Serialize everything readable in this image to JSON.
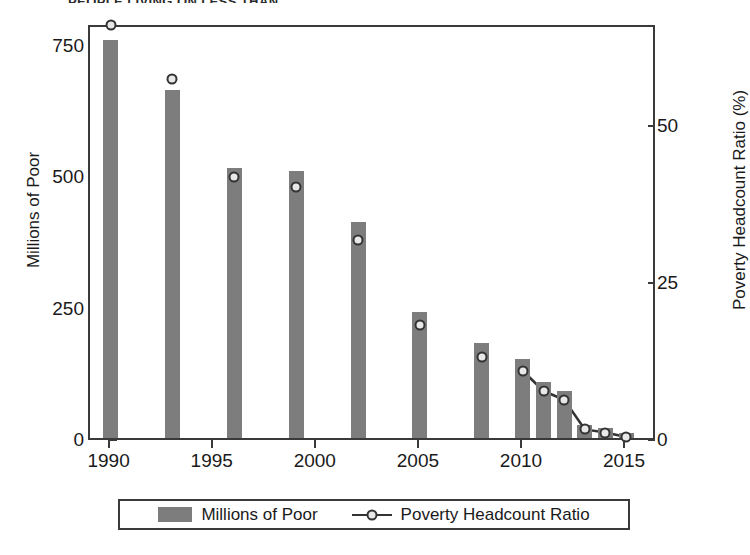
{
  "chart_data": {
    "type": "bar",
    "title": "PEOPLE LIVING ON LESS THAN",
    "xlabel": "",
    "ylabel": "Millions of Poor",
    "y2label": "Poverty Headcount Ratio (%)",
    "categories": [
      "1990",
      "1993",
      "1996",
      "1999",
      "2002",
      "2005",
      "2008",
      "2010",
      "2011",
      "2012",
      "2013",
      "2014",
      "2015"
    ],
    "x": [
      1990,
      1993,
      1996,
      1999,
      2002,
      2005,
      2008,
      2010,
      2011,
      2012,
      2013,
      2014,
      2015
    ],
    "xlim": [
      1989,
      2016.5
    ],
    "ylim": [
      0,
      790
    ],
    "y2lim": [
      0,
      66
    ],
    "grid": false,
    "legend_position": "bottom",
    "series": [
      {
        "name": "Millions of Poor",
        "type": "bar",
        "axis": "left",
        "color": "#7d7d7d",
        "values": [
          757,
          663,
          514,
          509,
          411,
          240,
          180,
          150,
          107,
          89,
          25,
          19,
          10
        ]
      },
      {
        "name": "Poverty Headcount Ratio",
        "type": "line",
        "axis": "right",
        "color": "#333333",
        "marker": "circle",
        "values": [
          66.3,
          57.8,
          42.2,
          40.6,
          32.1,
          18.6,
          13.5,
          11.3,
          8.1,
          6.7,
          2.0,
          1.5,
          0.8
        ]
      }
    ],
    "y_ticks_left": [
      0,
      250,
      500,
      750
    ],
    "y_ticks_right": [
      0,
      25,
      50
    ],
    "x_ticks": [
      1990,
      1995,
      2000,
      2005,
      2010,
      2015
    ],
    "line_connected_from": 2010
  },
  "legend": {
    "bar_label": "Millions of Poor",
    "line_label": "Poverty Headcount Ratio"
  },
  "ghost": {
    "g1": "",
    "g2": ""
  }
}
